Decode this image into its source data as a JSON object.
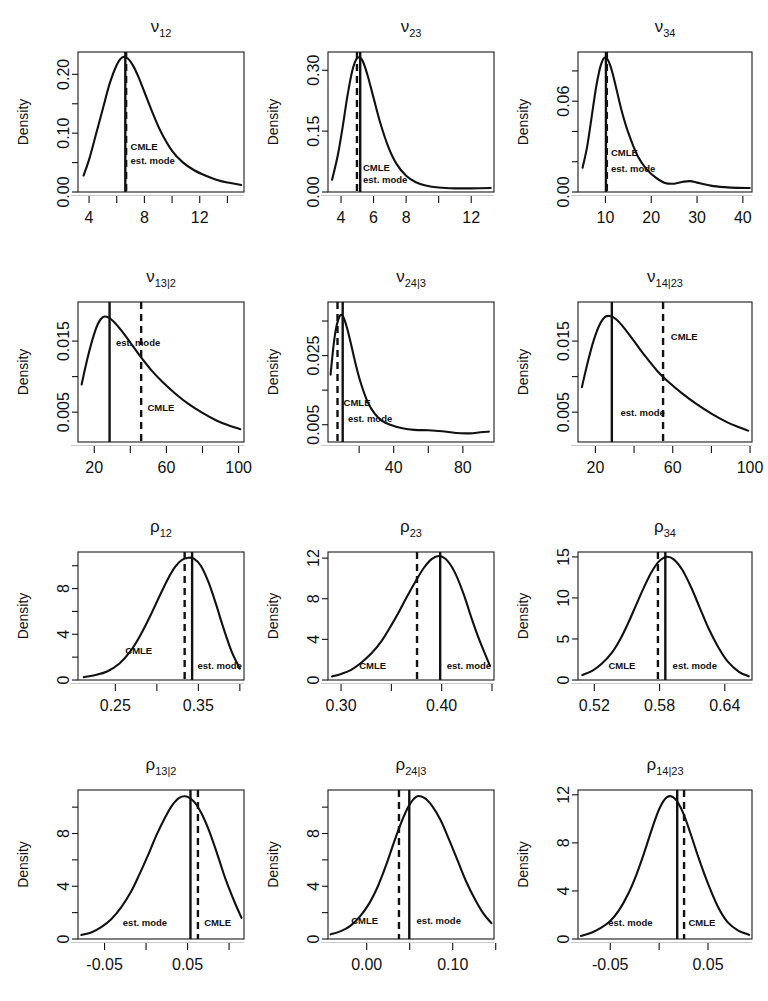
{
  "figure": {
    "background": "#ffffff",
    "rows": 4,
    "cols": 3,
    "y_axis_title": "Density",
    "annotation_labels": {
      "cmle": "CMLE",
      "mode": "est. mode"
    },
    "line_styles": {
      "cmle": "dashed",
      "mode": "solid"
    },
    "colors": {
      "curve": "#111111",
      "axis": "#1a1a1a",
      "baseline": "#c9c9c9"
    }
  },
  "chart_data": [
    {
      "type": "line",
      "id": "nu12",
      "title": "ν",
      "title_sub": "12",
      "ylabel": "Density",
      "xlabel": "",
      "xlim": [
        3.2,
        15.2
      ],
      "ylim": [
        0.0,
        0.238
      ],
      "xticks": [
        4,
        6,
        8,
        10,
        12,
        14
      ],
      "xtick_labels": [
        "4",
        "",
        "8",
        "",
        "12",
        ""
      ],
      "yticks": [
        0.0,
        0.05,
        0.1,
        0.15,
        0.2
      ],
      "ytick_labels": [
        "0.00",
        "",
        "0.10",
        "",
        "0.20"
      ],
      "grid": false,
      "x": [
        3.6,
        4.0,
        4.5,
        5.0,
        5.5,
        6.0,
        6.4,
        6.8,
        7.2,
        7.6,
        8.0,
        8.6,
        9.2,
        10.0,
        10.8,
        11.6,
        12.4,
        13.2,
        14.0,
        15.0
      ],
      "y": [
        0.028,
        0.055,
        0.098,
        0.142,
        0.185,
        0.216,
        0.229,
        0.227,
        0.214,
        0.194,
        0.17,
        0.134,
        0.102,
        0.07,
        0.05,
        0.037,
        0.028,
        0.021,
        0.016,
        0.012
      ],
      "markers": [
        {
          "name": "est. mode",
          "style": "solid",
          "x": 6.62,
          "label_x": 7.0,
          "label_y": 0.047
        },
        {
          "name": "CMLE",
          "style": "dashed",
          "x": 6.68,
          "label_x": 7.0,
          "label_y": 0.072
        }
      ]
    },
    {
      "type": "line",
      "id": "nu23",
      "title": "ν",
      "title_sub": "23",
      "ylabel": "Density",
      "xlabel": "",
      "xlim": [
        3.2,
        13.4
      ],
      "ylim": [
        0.0,
        0.345
      ],
      "xticks": [
        4,
        6,
        8,
        10,
        12
      ],
      "xtick_labels": [
        "4",
        "6",
        "8",
        "",
        "12"
      ],
      "yticks": [
        0.0,
        0.15,
        0.3
      ],
      "ytick_labels": [
        "0.00",
        "0.15",
        "0.30"
      ],
      "grid": false,
      "x": [
        3.45,
        3.8,
        4.1,
        4.4,
        4.7,
        5.0,
        5.3,
        5.6,
        6.0,
        6.4,
        6.9,
        7.4,
        8.0,
        8.6,
        9.2,
        10.0,
        11.0,
        12.0,
        13.2
      ],
      "y": [
        0.03,
        0.09,
        0.16,
        0.238,
        0.3,
        0.33,
        0.325,
        0.292,
        0.232,
        0.172,
        0.112,
        0.07,
        0.04,
        0.024,
        0.016,
        0.011,
        0.009,
        0.009,
        0.01
      ],
      "markers": [
        {
          "name": "est. mode",
          "style": "solid",
          "x": 5.18,
          "label_x": 5.35,
          "label_y": 0.022
        },
        {
          "name": "CMLE",
          "style": "dashed",
          "x": 4.98,
          "label_x": 5.35,
          "label_y": 0.052
        }
      ]
    },
    {
      "type": "line",
      "id": "nu34",
      "title": "ν",
      "title_sub": "34",
      "ylabel": "Density",
      "xlabel": "",
      "xlim": [
        4.0,
        42.0
      ],
      "ylim": [
        0.0,
        0.0925
      ],
      "xticks": [
        10,
        20,
        30,
        40
      ],
      "xtick_labels": [
        "10",
        "20",
        "30",
        "40"
      ],
      "yticks": [
        0.0,
        0.02,
        0.04,
        0.06,
        0.08
      ],
      "ytick_labels": [
        "0.00",
        "",
        "",
        "0.06",
        ""
      ],
      "grid": false,
      "x": [
        5.0,
        6.0,
        7.0,
        8.0,
        9.0,
        10.0,
        11.0,
        12.0,
        13.5,
        15.0,
        17.0,
        19.0,
        21.0,
        23.0,
        25.0,
        27.0,
        28.5,
        30.0,
        33.0,
        36.0,
        39.0,
        41.5
      ],
      "y": [
        0.016,
        0.03,
        0.05,
        0.07,
        0.084,
        0.089,
        0.084,
        0.073,
        0.054,
        0.039,
        0.024,
        0.015,
        0.0095,
        0.006,
        0.0055,
        0.0068,
        0.0072,
        0.0062,
        0.0042,
        0.0032,
        0.0027,
        0.0026
      ],
      "markers": [
        {
          "name": "est. mode",
          "style": "solid",
          "x": 10.1,
          "label_x": 11.2,
          "label_y": 0.0135
        },
        {
          "name": "CMLE",
          "style": "dashed",
          "x": 10.3,
          "label_x": 11.2,
          "label_y": 0.0235
        }
      ]
    },
    {
      "type": "line",
      "id": "nu13g2",
      "title": "ν",
      "title_sub": "13|2",
      "ylabel": "Density",
      "xlabel": "",
      "xlim": [
        11.0,
        103.0
      ],
      "ylim": [
        0.0008,
        0.0205
      ],
      "xticks": [
        20,
        40,
        60,
        80,
        100
      ],
      "xtick_labels": [
        "20",
        "",
        "60",
        "",
        "100"
      ],
      "yticks": [
        0.005,
        0.01,
        0.015
      ],
      "ytick_labels": [
        "0.005",
        "",
        "0.015"
      ],
      "grid": false,
      "x": [
        13.0,
        16.0,
        19.0,
        22.0,
        25.0,
        28.0,
        31.0,
        35.0,
        40.0,
        46.0,
        52.0,
        58.0,
        65.0,
        72.0,
        80.0,
        88.0,
        95.0,
        101.0
      ],
      "y": [
        0.0089,
        0.0123,
        0.0152,
        0.0174,
        0.0184,
        0.0183,
        0.0177,
        0.0165,
        0.0148,
        0.0127,
        0.0108,
        0.0092,
        0.0076,
        0.0062,
        0.0049,
        0.0038,
        0.0031,
        0.0026
      ],
      "markers": [
        {
          "name": "est. mode",
          "style": "solid",
          "x": 28.5,
          "label_x": 32.0,
          "label_y": 0.0143
        },
        {
          "name": "CMLE",
          "style": "dashed",
          "x": 46.0,
          "label_x": 49.5,
          "label_y": 0.0052
        }
      ]
    },
    {
      "type": "line",
      "id": "nu24g3",
      "title": "ν",
      "title_sub": "24|3",
      "ylabel": "Density",
      "xlabel": "",
      "xlim": [
        2.0,
        98.0
      ],
      "ylim": [
        0.0,
        0.0405
      ],
      "xticks": [
        0,
        20,
        40,
        60,
        80
      ],
      "xtick_labels": [
        "0",
        "",
        "40",
        "",
        "80"
      ],
      "yticks": [
        0.005,
        0.015,
        0.025,
        0.035
      ],
      "ytick_labels": [
        "0.005",
        "",
        "0.025",
        ""
      ],
      "grid": false,
      "x": [
        3.5,
        5.0,
        6.5,
        8.0,
        9.5,
        11.0,
        13.0,
        15.0,
        18.0,
        21.0,
        25.0,
        29.0,
        33.0,
        38.0,
        45.0,
        52.0,
        60.0,
        68.0,
        76.0,
        84.0,
        90.0,
        95.0
      ],
      "y": [
        0.0195,
        0.027,
        0.0325,
        0.0355,
        0.0368,
        0.036,
        0.033,
        0.029,
        0.0225,
        0.017,
        0.0115,
        0.0082,
        0.0062,
        0.005,
        0.004,
        0.0035,
        0.0034,
        0.0031,
        0.0026,
        0.0025,
        0.0028,
        0.003
      ],
      "markers": [
        {
          "name": "est. mode",
          "style": "solid",
          "x": 10.5,
          "label_x": 13.5,
          "label_y": 0.0058
        },
        {
          "name": "CMLE",
          "style": "dashed",
          "x": 7.5,
          "label_x": 11.0,
          "label_y": 0.0105
        }
      ]
    },
    {
      "type": "line",
      "id": "nu14g23",
      "title": "ν",
      "title_sub": "14|23",
      "ylabel": "Density",
      "xlabel": "",
      "xlim": [
        11.0,
        101.0
      ],
      "ylim": [
        0.0008,
        0.0205
      ],
      "xticks": [
        20,
        40,
        60,
        80,
        100
      ],
      "xtick_labels": [
        "20",
        "",
        "60",
        "",
        "100"
      ],
      "yticks": [
        0.005,
        0.01,
        0.015
      ],
      "ytick_labels": [
        "0.005",
        "",
        "0.015"
      ],
      "grid": false,
      "x": [
        13.0,
        16.0,
        19.0,
        22.0,
        25.0,
        28.0,
        31.0,
        35.0,
        40.0,
        46.0,
        52.0,
        58.0,
        65.0,
        72.0,
        80.0,
        88.0,
        94.0,
        99.0
      ],
      "y": [
        0.0085,
        0.012,
        0.015,
        0.0172,
        0.0184,
        0.0185,
        0.018,
        0.0168,
        0.015,
        0.0128,
        0.0108,
        0.0092,
        0.0076,
        0.0062,
        0.0048,
        0.0036,
        0.0029,
        0.0024
      ],
      "markers": [
        {
          "name": "est. mode",
          "style": "solid",
          "x": 28.5,
          "label_x": 33.0,
          "label_y": 0.0045
        },
        {
          "name": "CMLE",
          "style": "dashed",
          "x": 55.0,
          "label_x": 59.0,
          "label_y": 0.0152
        }
      ]
    },
    {
      "type": "line",
      "id": "rho12",
      "title": "ρ",
      "title_sub": "12",
      "ylabel": "Density",
      "xlabel": "",
      "xlim": [
        0.205,
        0.405
      ],
      "ylim": [
        0.0,
        11.2
      ],
      "xticks": [
        0.25,
        0.3,
        0.35,
        0.4
      ],
      "xtick_labels": [
        "0.25",
        "",
        "0.35",
        ""
      ],
      "yticks": [
        0,
        2,
        4,
        6,
        8,
        10
      ],
      "ytick_labels": [
        "0",
        "",
        "4",
        "",
        "8",
        ""
      ],
      "grid": false,
      "x": [
        0.212,
        0.225,
        0.24,
        0.255,
        0.268,
        0.28,
        0.292,
        0.303,
        0.313,
        0.322,
        0.33,
        0.338,
        0.345,
        0.353,
        0.362,
        0.371,
        0.38,
        0.39,
        0.4
      ],
      "y": [
        0.25,
        0.42,
        0.75,
        1.45,
        2.5,
        3.9,
        5.6,
        7.3,
        8.8,
        9.9,
        10.5,
        10.7,
        10.6,
        10.0,
        8.6,
        6.7,
        4.6,
        2.5,
        1.0
      ],
      "markers": [
        {
          "name": "est. mode",
          "style": "solid",
          "x": 0.3425,
          "label_x": 0.349,
          "label_y": 1.0
        },
        {
          "name": "CMLE",
          "style": "dashed",
          "x": 0.3335,
          "label_x": 0.262,
          "label_y": 2.3
        }
      ]
    },
    {
      "type": "line",
      "id": "rho23",
      "title": "ρ",
      "title_sub": "23",
      "ylabel": "Density",
      "xlabel": "",
      "xlim": [
        0.287,
        0.452
      ],
      "ylim": [
        0.0,
        12.6
      ],
      "xticks": [
        0.3,
        0.35,
        0.4,
        0.45
      ],
      "xtick_labels": [
        "0.30",
        "",
        "0.40",
        ""
      ],
      "yticks": [
        0,
        4,
        8,
        12
      ],
      "ytick_labels": [
        "0",
        "4",
        "8",
        "12"
      ],
      "grid": false,
      "x": [
        0.291,
        0.3,
        0.31,
        0.32,
        0.33,
        0.34,
        0.35,
        0.358,
        0.366,
        0.374,
        0.382,
        0.39,
        0.398,
        0.406,
        0.414,
        0.422,
        0.43,
        0.438,
        0.448
      ],
      "y": [
        0.35,
        0.6,
        1.0,
        1.7,
        2.6,
        3.8,
        5.4,
        6.8,
        8.3,
        9.7,
        11.0,
        11.9,
        12.2,
        11.7,
        10.4,
        8.4,
        6.0,
        3.8,
        1.4
      ],
      "markers": [
        {
          "name": "est. mode",
          "style": "solid",
          "x": 0.3985,
          "label_x": 0.405,
          "label_y": 1.1
        },
        {
          "name": "CMLE",
          "style": "dashed",
          "x": 0.3755,
          "label_x": 0.318,
          "label_y": 1.1
        }
      ]
    },
    {
      "type": "line",
      "id": "rho34",
      "title": "ρ",
      "title_sub": "34",
      "ylabel": "Density",
      "xlabel": "",
      "xlim": [
        0.505,
        0.665
      ],
      "ylim": [
        0.0,
        15.6
      ],
      "xticks": [
        0.52,
        0.58,
        0.64
      ],
      "xtick_labels": [
        "0.52",
        "0.58",
        "0.64"
      ],
      "yticks": [
        0,
        5,
        10,
        15
      ],
      "ytick_labels": [
        "0",
        "5",
        "10",
        "15"
      ],
      "grid": false,
      "x": [
        0.509,
        0.518,
        0.527,
        0.536,
        0.544,
        0.551,
        0.558,
        0.565,
        0.572,
        0.579,
        0.586,
        0.593,
        0.601,
        0.609,
        0.617,
        0.625,
        0.634,
        0.643,
        0.653,
        0.662
      ],
      "y": [
        0.6,
        1.1,
        2.0,
        3.3,
        5.0,
        6.9,
        9.0,
        11.1,
        13.0,
        14.4,
        15.0,
        14.7,
        13.4,
        11.3,
        8.8,
        6.3,
        4.0,
        2.2,
        1.0,
        0.45
      ],
      "markers": [
        {
          "name": "est. mode",
          "style": "solid",
          "x": 0.5853,
          "label_x": 0.592,
          "label_y": 1.3
        },
        {
          "name": "CMLE",
          "style": "dashed",
          "x": 0.5785,
          "label_x": 0.533,
          "label_y": 1.3
        }
      ]
    },
    {
      "type": "line",
      "id": "rho13g2",
      "title": "ρ",
      "title_sub": "13|2",
      "ylabel": "Density",
      "xlabel": "",
      "xlim": [
        -0.082,
        0.118
      ],
      "ylim": [
        0.0,
        11.3
      ],
      "xticks": [
        -0.05,
        0.0,
        0.05,
        0.1
      ],
      "xtick_labels": [
        "-0.05",
        "",
        "0.05",
        ""
      ],
      "yticks": [
        0,
        2,
        4,
        6,
        8,
        10
      ],
      "ytick_labels": [
        "0",
        "",
        "4",
        "",
        "8",
        ""
      ],
      "grid": false,
      "x": [
        -0.078,
        -0.066,
        -0.054,
        -0.042,
        -0.03,
        -0.018,
        -0.008,
        0.002,
        0.012,
        0.022,
        0.031,
        0.04,
        0.049,
        0.058,
        0.067,
        0.076,
        0.086,
        0.096,
        0.106,
        0.115
      ],
      "y": [
        0.3,
        0.5,
        0.9,
        1.5,
        2.4,
        3.6,
        4.9,
        6.3,
        7.8,
        9.1,
        10.1,
        10.7,
        10.8,
        10.4,
        9.5,
        8.2,
        6.4,
        4.5,
        2.9,
        1.6
      ],
      "markers": [
        {
          "name": "est. mode",
          "style": "solid",
          "x": 0.0535,
          "label_x": -0.028,
          "label_y": 1.0
        },
        {
          "name": "CMLE",
          "style": "dashed",
          "x": 0.0625,
          "label_x": 0.07,
          "label_y": 1.0
        }
      ]
    },
    {
      "type": "line",
      "id": "rho24g3",
      "title": "ρ",
      "title_sub": "24|3",
      "ylabel": "Density",
      "xlabel": "",
      "xlim": [
        -0.045,
        0.148
      ],
      "ylim": [
        0.0,
        11.3
      ],
      "xticks": [
        -0.05,
        0.0,
        0.05,
        0.1,
        0.15
      ],
      "xtick_labels": [
        "",
        "0.00",
        "",
        "0.10",
        ""
      ],
      "yticks": [
        0,
        2,
        4,
        6,
        8,
        10
      ],
      "ytick_labels": [
        "0",
        "",
        "4",
        "",
        "8",
        ""
      ],
      "grid": false,
      "x": [
        -0.042,
        -0.03,
        -0.019,
        -0.008,
        0.003,
        0.013,
        0.022,
        0.031,
        0.04,
        0.049,
        0.058,
        0.067,
        0.076,
        0.086,
        0.096,
        0.106,
        0.116,
        0.126,
        0.136,
        0.145
      ],
      "y": [
        0.35,
        0.6,
        1.0,
        1.7,
        2.7,
        4.0,
        5.5,
        7.2,
        8.8,
        10.1,
        10.8,
        10.7,
        10.1,
        9.0,
        7.5,
        5.9,
        4.3,
        3.0,
        1.9,
        1.2
      ],
      "markers": [
        {
          "name": "est. mode",
          "style": "solid",
          "x": 0.0495,
          "label_x": 0.058,
          "label_y": 1.1
        },
        {
          "name": "CMLE",
          "style": "dashed",
          "x": 0.0375,
          "label_x": -0.018,
          "label_y": 1.1
        }
      ]
    },
    {
      "type": "line",
      "id": "rho14g23",
      "title": "ρ",
      "title_sub": "14|23",
      "ylabel": "Density",
      "xlabel": "",
      "xlim": [
        -0.083,
        0.095
      ],
      "ylim": [
        0.0,
        12.4
      ],
      "xticks": [
        -0.05,
        0.0,
        0.05
      ],
      "xtick_labels": [
        "-0.05",
        "",
        "0.05"
      ],
      "yticks": [
        0,
        4,
        8,
        12
      ],
      "ytick_labels": [
        "0",
        "4",
        "8",
        "12"
      ],
      "grid": false,
      "x": [
        -0.08,
        -0.07,
        -0.06,
        -0.05,
        -0.041,
        -0.032,
        -0.024,
        -0.016,
        -0.008,
        0.0,
        0.008,
        0.016,
        0.024,
        0.032,
        0.041,
        0.05,
        0.06,
        0.07,
        0.081,
        0.092
      ],
      "y": [
        0.25,
        0.5,
        0.9,
        1.5,
        2.4,
        3.7,
        5.2,
        7.0,
        9.0,
        10.8,
        11.8,
        11.7,
        10.6,
        8.8,
        6.6,
        4.6,
        2.7,
        1.4,
        0.7,
        0.35
      ],
      "markers": [
        {
          "name": "est. mode",
          "style": "solid",
          "x": 0.0185,
          "label_x": -0.052,
          "label_y": 1.1
        },
        {
          "name": "CMLE",
          "style": "dashed",
          "x": 0.0255,
          "label_x": 0.03,
          "label_y": 1.1
        }
      ]
    }
  ]
}
